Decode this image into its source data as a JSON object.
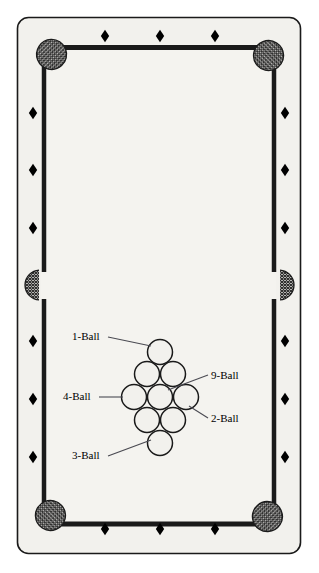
{
  "diagram": {
    "table": {
      "felt_color": "#f2f1ed",
      "outer_border_color": "#1a1a1a",
      "cushion_color": "#1a1a1a",
      "pocket_fill": "#4d4d4d",
      "ball_outline_color": "#1a1a1a",
      "ball_fill": "#f2f1ed",
      "leader_line_color": "#4a4a52",
      "outer_frame": {
        "x": 17,
        "y": 17,
        "width": 283,
        "height": 536,
        "radius": 11
      },
      "playing_area": {
        "x": 41,
        "y": 44,
        "width": 235,
        "height": 482
      }
    },
    "rail_diamonds": {
      "count": 18,
      "shape": "diamond",
      "color": "#000000",
      "top": [
        {
          "x": 105,
          "y": 36
        },
        {
          "x": 160,
          "y": 36
        },
        {
          "x": 215,
          "y": 36
        }
      ],
      "bottom": [
        {
          "x": 105,
          "y": 529
        },
        {
          "x": 160,
          "y": 529
        },
        {
          "x": 215,
          "y": 529
        }
      ],
      "left": [
        {
          "x": 33,
          "y": 113
        },
        {
          "x": 33,
          "y": 170
        },
        {
          "x": 33,
          "y": 228
        },
        {
          "x": 33,
          "y": 341
        },
        {
          "x": 33,
          "y": 399
        },
        {
          "x": 33,
          "y": 457
        }
      ],
      "right": [
        {
          "x": 285,
          "y": 113
        },
        {
          "x": 285,
          "y": 170
        },
        {
          "x": 285,
          "y": 228
        },
        {
          "x": 285,
          "y": 341
        },
        {
          "x": 285,
          "y": 399
        },
        {
          "x": 285,
          "y": 457
        }
      ]
    },
    "pockets": [
      {
        "name": "top-left-corner-pocket",
        "type": "corner",
        "cx": 51,
        "cy": 55
      },
      {
        "name": "top-right-corner-pocket",
        "type": "corner",
        "cx": 268,
        "cy": 55
      },
      {
        "name": "left-side-pocket",
        "type": "side",
        "cx": 39,
        "cy": 285
      },
      {
        "name": "right-side-pocket",
        "type": "side",
        "cx": 280,
        "cy": 285
      },
      {
        "name": "bottom-left-corner-pocket",
        "type": "corner",
        "cx": 51,
        "cy": 516
      },
      {
        "name": "bottom-right-corner-pocket",
        "type": "corner",
        "cx": 268,
        "cy": 516
      }
    ],
    "rack": {
      "formation": "diamond",
      "ball_radius": 12.5,
      "ball_count": 9,
      "balls": [
        {
          "name": "1-ball",
          "cx": 160,
          "cy": 352
        },
        {
          "name": "rack-ball-upper-left",
          "cx": 147,
          "cy": 374
        },
        {
          "name": "rack-ball-upper-right",
          "cx": 173,
          "cy": 374
        },
        {
          "name": "4-ball",
          "cx": 134,
          "cy": 397
        },
        {
          "name": "9-ball",
          "cx": 160,
          "cy": 397
        },
        {
          "name": "2-ball",
          "cx": 186,
          "cy": 397
        },
        {
          "name": "rack-ball-lower-left",
          "cx": 147,
          "cy": 420
        },
        {
          "name": "rack-ball-lower-right",
          "cx": 173,
          "cy": 420
        },
        {
          "name": "3-ball",
          "cx": 160,
          "cy": 443
        }
      ]
    },
    "callouts": [
      {
        "id": "1-ball",
        "label": "1-Ball",
        "label_x": 72,
        "label_y": 331,
        "leader": {
          "x1": 108,
          "y1": 337,
          "x2": 151,
          "y2": 346
        }
      },
      {
        "id": "9-ball",
        "label": "9-Ball",
        "label_x": 211,
        "label_y": 370,
        "leader": {
          "x1": 208,
          "y1": 375,
          "x2": 168,
          "y2": 390
        }
      },
      {
        "id": "4-ball",
        "label": "4-Ball",
        "label_x": 63,
        "label_y": 391,
        "leader": {
          "x1": 99,
          "y1": 397,
          "x2": 123,
          "y2": 397
        }
      },
      {
        "id": "2-ball",
        "label": "2-Ball",
        "label_x": 211,
        "label_y": 413,
        "leader": {
          "x1": 208,
          "y1": 418,
          "x2": 189,
          "y2": 406
        }
      },
      {
        "id": "3-ball",
        "label": "3-Ball",
        "label_x": 72,
        "label_y": 450,
        "leader": {
          "x1": 108,
          "y1": 456,
          "x2": 151,
          "y2": 440
        }
      }
    ]
  }
}
